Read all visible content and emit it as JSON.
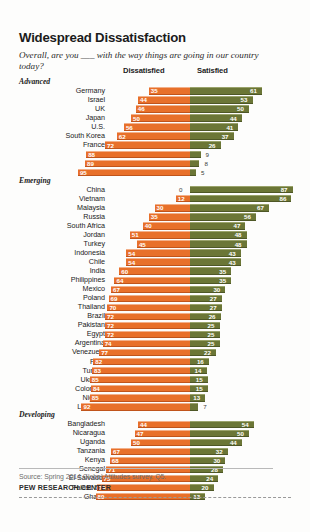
{
  "header": {
    "title": "Widespread Dissatisfaction",
    "subtitle": "Overall, are you ___ with the way things are going in our country today?"
  },
  "columns": {
    "dissatisfied": "Dissatisfied",
    "satisfied": "Satisfied"
  },
  "footer": {
    "source": "Source: Spring 2014 Global Attitudes survey. Q5.",
    "org": "PEW RESEARCH CENTER"
  },
  "colors": {
    "dissatisfied": "#e8702a",
    "satisfied": "#6b7636",
    "text": "#231f20",
    "source_text": "#6d6d6d"
  },
  "chart_data": {
    "type": "bar",
    "title": "Widespread Dissatisfaction",
    "subtitle": "Overall, are you ___ with the way things are going in our country today?",
    "orientation": "horizontal",
    "style": "diverging-stacked",
    "xlabel": "",
    "ylabel": "",
    "xunit": "%",
    "grid": false,
    "legend_position": "top",
    "series": [
      {
        "name": "Dissatisfied",
        "color": "#e8702a",
        "align": "right-to-left"
      },
      {
        "name": "Satisfied",
        "color": "#6b7636",
        "align": "left-to-right"
      }
    ],
    "groups": [
      {
        "name": "Advanced",
        "rows": [
          {
            "country": "Germany",
            "dissatisfied": 35,
            "satisfied": 61
          },
          {
            "country": "Israel",
            "dissatisfied": 44,
            "satisfied": 53
          },
          {
            "country": "UK",
            "dissatisfied": 46,
            "satisfied": 50
          },
          {
            "country": "Japan",
            "dissatisfied": 50,
            "satisfied": 44
          },
          {
            "country": "U.S.",
            "dissatisfied": 56,
            "satisfied": 41
          },
          {
            "country": "South Korea",
            "dissatisfied": 62,
            "satisfied": 37
          },
          {
            "country": "France",
            "dissatisfied": 72,
            "satisfied": 26
          },
          {
            "country": "Italy",
            "dissatisfied": 88,
            "satisfied": 9
          },
          {
            "country": "Spain",
            "dissatisfied": 89,
            "satisfied": 8
          },
          {
            "country": "Greece",
            "dissatisfied": 95,
            "satisfied": 5
          }
        ]
      },
      {
        "name": "Emerging",
        "rows": [
          {
            "country": "China",
            "dissatisfied": 0,
            "satisfied": 87
          },
          {
            "country": "Vietnam",
            "dissatisfied": 12,
            "satisfied": 86
          },
          {
            "country": "Malaysia",
            "dissatisfied": 30,
            "satisfied": 67
          },
          {
            "country": "Russia",
            "dissatisfied": 35,
            "satisfied": 56
          },
          {
            "country": "South Africa",
            "dissatisfied": 40,
            "satisfied": 47
          },
          {
            "country": "Jordan",
            "dissatisfied": 51,
            "satisfied": 48
          },
          {
            "country": "Turkey",
            "dissatisfied": 45,
            "satisfied": 48
          },
          {
            "country": "Indonesia",
            "dissatisfied": 54,
            "satisfied": 43
          },
          {
            "country": "Chile",
            "dissatisfied": 54,
            "satisfied": 43
          },
          {
            "country": "India",
            "dissatisfied": 60,
            "satisfied": 35
          },
          {
            "country": "Philippines",
            "dissatisfied": 64,
            "satisfied": 35
          },
          {
            "country": "Mexico",
            "dissatisfied": 67,
            "satisfied": 30
          },
          {
            "country": "Poland",
            "dissatisfied": 69,
            "satisfied": 27
          },
          {
            "country": "Thailand",
            "dissatisfied": 70,
            "satisfied": 27
          },
          {
            "country": "Brazil",
            "dissatisfied": 72,
            "satisfied": 26
          },
          {
            "country": "Pakistan",
            "dissatisfied": 72,
            "satisfied": 25
          },
          {
            "country": "Egypt",
            "dissatisfied": 72,
            "satisfied": 25
          },
          {
            "country": "Argentina",
            "dissatisfied": 74,
            "satisfied": 25
          },
          {
            "country": "Venezuela",
            "dissatisfied": 77,
            "satisfied": 22
          },
          {
            "country": "Peru",
            "dissatisfied": 82,
            "satisfied": 16
          },
          {
            "country": "Tunisia",
            "dissatisfied": 83,
            "satisfied": 14
          },
          {
            "country": "Ukraine",
            "dissatisfied": 85,
            "satisfied": 15
          },
          {
            "country": "Colombia",
            "dissatisfied": 84,
            "satisfied": 15
          },
          {
            "country": "Nigeria",
            "dissatisfied": 85,
            "satisfied": 13
          },
          {
            "country": "Lebanon",
            "dissatisfied": 92,
            "satisfied": 7
          }
        ]
      },
      {
        "name": "Developing",
        "rows": [
          {
            "country": "Bangladesh",
            "dissatisfied": 44,
            "satisfied": 54
          },
          {
            "country": "Nicaragua",
            "dissatisfied": 47,
            "satisfied": 50
          },
          {
            "country": "Uganda",
            "dissatisfied": 50,
            "satisfied": 44
          },
          {
            "country": "Tanzania",
            "dissatisfied": 67,
            "satisfied": 32
          },
          {
            "country": "Kenya",
            "dissatisfied": 68,
            "satisfied": 30
          },
          {
            "country": "Senegal",
            "dissatisfied": 71,
            "satisfied": 28
          },
          {
            "country": "El Salvador",
            "dissatisfied": 75,
            "satisfied": 24
          },
          {
            "country": "Palest. ter.",
            "dissatisfied": 79,
            "satisfied": 20
          },
          {
            "country": "Ghana",
            "dissatisfied": 80,
            "satisfied": 13
          }
        ]
      }
    ]
  }
}
